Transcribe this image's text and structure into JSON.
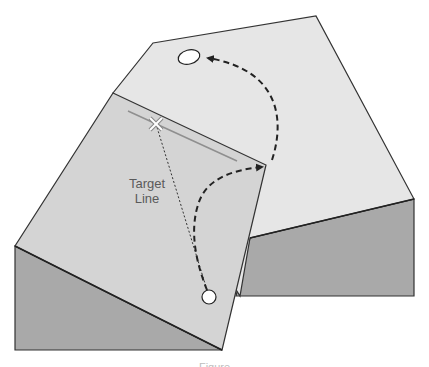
{
  "diagram": {
    "type": "putting-green-slope-illustration",
    "labels": {
      "target_line": "Target\nLine",
      "target_line_line1": "Target",
      "target_line_line2": "Line"
    },
    "caption": "Figure",
    "colors": {
      "background": "#ffffff",
      "top_surface_back": "#e6e6e6",
      "top_surface_front": "#d4d4d4",
      "side_face": "#a9a9a9",
      "outline": "#333333",
      "target_line": "#8f8f8f",
      "path_dash": "#222222",
      "marker_fill": "#ffffff"
    },
    "elements": {
      "back_block": {
        "top_polygon": [
          [
            153,
            43
          ],
          [
            316,
            16
          ],
          [
            414,
            199
          ],
          [
            250,
            238
          ],
          [
            236,
            295
          ]
        ],
        "side_polygon": [
          [
            250,
            238
          ],
          [
            414,
            199
          ],
          [
            414,
            296
          ],
          [
            236,
            296
          ]
        ]
      },
      "front_block": {
        "top_polygon": [
          [
            113,
            93
          ],
          [
            266,
            165
          ],
          [
            222,
            350
          ],
          [
            15,
            246
          ]
        ],
        "side_polygon": [
          [
            15,
            246
          ],
          [
            222,
            350
          ],
          [
            15,
            350
          ]
        ]
      },
      "hole": {
        "cx": 189,
        "cy": 57,
        "rx": 11,
        "ry": 7
      },
      "ball": {
        "cx": 209,
        "cy": 297,
        "r": 7
      },
      "aim_mark": {
        "x": 156,
        "y": 124,
        "symbol": "✕"
      },
      "target_line_segment": [
        [
          128,
          111
        ],
        [
          237,
          161
        ]
      ]
    }
  }
}
